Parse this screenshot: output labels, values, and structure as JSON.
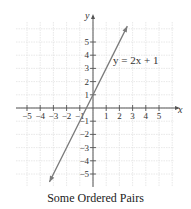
{
  "chart_data": {
    "type": "line",
    "title": "Some Ordered Pairs",
    "xlabel": "x",
    "ylabel": "y",
    "xlim": [
      -6,
      6
    ],
    "ylim": [
      -6,
      6
    ],
    "grid": true,
    "x_ticks": [
      -5,
      -4,
      -3,
      -2,
      -1,
      1,
      2,
      3,
      4,
      5
    ],
    "y_ticks": [
      -5,
      -4,
      -3,
      -2,
      -1,
      1,
      2,
      3,
      4,
      5
    ],
    "x_tick_labels": [
      "−5",
      "−4",
      "−3",
      "−2",
      "−1",
      "1",
      "2",
      "3",
      "4",
      "5"
    ],
    "y_tick_labels": [
      "−5",
      "−4",
      "−3",
      "−2",
      "−1",
      "1",
      "2",
      "3",
      "4",
      "5"
    ],
    "series": [
      {
        "name": "y = 2x + 1",
        "equation": "y = 2x + 1",
        "slope": 2,
        "intercept": 1,
        "x": [
          -3.3,
          2.6
        ],
        "y": [
          -5.6,
          6.2
        ],
        "arrows": "both",
        "color": "#7a7a7a"
      }
    ],
    "annotations": [
      {
        "text": "y = 2x + 1",
        "x": 1.5,
        "y": 3.5
      }
    ]
  },
  "caption": "Some Ordered Pairs",
  "axes": {
    "x_name": "x",
    "y_name": "y"
  },
  "colors": {
    "grid": "#e2e2e2",
    "axis": "#555555",
    "line": "#7a7a7a",
    "text": "#333333"
  }
}
